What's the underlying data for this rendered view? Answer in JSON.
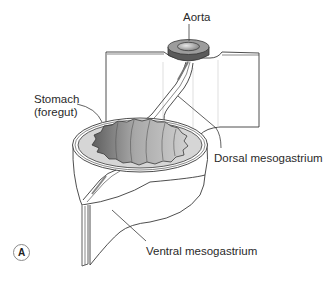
{
  "figure": {
    "panel_label": "A",
    "labels": {
      "aorta": "Aorta",
      "stomach_line1": "Stomach",
      "stomach_line2": "(foregut)",
      "dorsal_mesogastrium": "Dorsal mesogastrium",
      "ventral_mesogastrium": "Ventral mesogastrium"
    },
    "colors": {
      "line": "#3a3a3a",
      "aorta_ring": "#6a6a6a",
      "lumen_dark": "#7a7a7a",
      "lumen_light": "#bdbdbd",
      "wall_fill": "#d9d9d9",
      "sheet_fill": "#ffffff"
    }
  }
}
